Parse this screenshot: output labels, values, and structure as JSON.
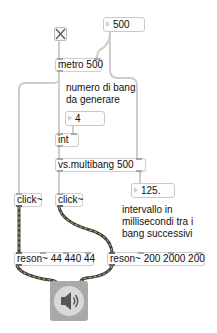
{
  "patch": {
    "toggle": {
      "state": "on",
      "icon": "x-toggle-icon"
    },
    "number_interval_top": {
      "value": "500"
    },
    "metro": {
      "text": "metro 500"
    },
    "comment_num_bang": {
      "line1": "numero di bang",
      "line2": "da generare"
    },
    "number_count": {
      "value": "4"
    },
    "int_obj": {
      "text": "int"
    },
    "multibang": {
      "text": "vs.multibang 500"
    },
    "number_interval_out": {
      "value": "125."
    },
    "comment_interval": {
      "line1": "intervallo in",
      "line2": "millisecondi tra i",
      "line3": "bang successivi"
    },
    "click_left": {
      "text": "click~"
    },
    "click_right": {
      "text": "click~"
    },
    "reson_left": {
      "text": "reson~ 44 440 44"
    },
    "reson_right": {
      "text": "reson~ 200 2000 200"
    },
    "dac": {
      "icon": "speaker-icon"
    }
  },
  "colors": {
    "control_cord": "#c9c9c9",
    "signal_cord": "#4a4a4a",
    "signal_cord_stripe": "#d8c060",
    "box_border": "#cfcfcf",
    "dac_bg": "#a9a9a9"
  }
}
